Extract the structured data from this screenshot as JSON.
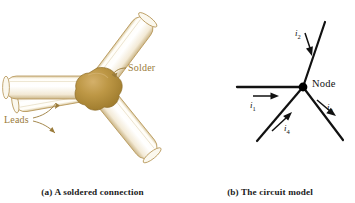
{
  "figure": {
    "background_color": "#ffffff",
    "panels": [
      {
        "id": "a",
        "caption": "(a)  A soldered connection",
        "labels": {
          "solder": "Solder",
          "leads": "Leads"
        },
        "colors": {
          "solder_fill": "#b99341",
          "solder_fill_light": "#cdab63",
          "solder_edge": "#8e6d28",
          "lead_fill": "#fdfcf6",
          "lead_edge": "#b99a5e",
          "label_text": "#9a7b3a"
        },
        "lead_count": 4,
        "lead_directions": [
          "left",
          "up-right",
          "down-left",
          "down-right"
        ]
      },
      {
        "id": "b",
        "caption": "(b)  The circuit model",
        "labels": {
          "node": "Node"
        },
        "currents": [
          {
            "name": "i",
            "subscript": "1",
            "direction": "toward-node-right"
          },
          {
            "name": "i",
            "subscript": "2",
            "direction": "toward-node-down"
          },
          {
            "name": "i",
            "subscript": "3",
            "direction": "away-from-node-down-right"
          },
          {
            "name": "i",
            "subscript": "4",
            "direction": "toward-node-up-right"
          }
        ],
        "colors": {
          "wire": "#111111",
          "node_dot": "#000000",
          "arrow": "#111111",
          "label_text": "#111111"
        },
        "branch_count": 4,
        "branch_directions": [
          "left",
          "up-right",
          "down-right",
          "down-left"
        ]
      }
    ]
  }
}
